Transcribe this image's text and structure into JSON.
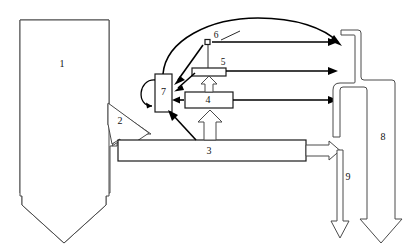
{
  "diagram": {
    "type": "process-flow-schematic",
    "background_color": "#ffffff",
    "line_color": "#000000",
    "hollow_fill": "#ffffff",
    "label_color": "#111111",
    "labels": [
      {
        "id": "1",
        "text": "1",
        "x": 62,
        "y": 65,
        "component": "large-downward-hollow-arrow"
      },
      {
        "id": "2",
        "text": "2",
        "x": 120,
        "y": 122,
        "component": "branch-hollow-arrow"
      },
      {
        "id": "3",
        "text": "3",
        "x": 209,
        "y": 151,
        "component": "horizontal-duct"
      },
      {
        "id": "4",
        "text": "4",
        "x": 207,
        "y": 100,
        "component": "unit-box-4"
      },
      {
        "id": "5",
        "text": "5",
        "x": 223,
        "y": 64,
        "component": "unit-box-5"
      },
      {
        "id": "6",
        "text": "6",
        "x": 214,
        "y": 38,
        "component": "node-6"
      },
      {
        "id": "7",
        "text": "7",
        "x": 163,
        "y": 93,
        "component": "vertical-box-7"
      },
      {
        "id": "8",
        "text": "8",
        "x": 383,
        "y": 138,
        "component": "right-hollow-duct"
      },
      {
        "id": "9",
        "text": "9",
        "x": 348,
        "y": 178,
        "component": "downward-hollow-arrow-9"
      }
    ],
    "components": [
      {
        "name": "large-downward-hollow-arrow",
        "label": "1",
        "style": "hollow-outline"
      },
      {
        "name": "branch-hollow-arrow",
        "label": "2",
        "style": "hollow-outline"
      },
      {
        "name": "horizontal-duct",
        "label": "3",
        "style": "outlined-rectangle"
      },
      {
        "name": "unit-box-4",
        "label": "4",
        "style": "outlined-rectangle"
      },
      {
        "name": "unit-box-5",
        "label": "5",
        "style": "outlined-rectangle"
      },
      {
        "name": "node-6",
        "label": "6",
        "style": "small-square-node"
      },
      {
        "name": "vertical-box-7",
        "label": "7",
        "style": "outlined-rectangle-with-recycle-loop"
      },
      {
        "name": "right-hollow-duct",
        "label": "8",
        "style": "hollow-outline-pipe"
      },
      {
        "name": "downward-hollow-arrow-9",
        "label": "9",
        "style": "hollow-outline"
      }
    ],
    "flows": [
      {
        "from": "1",
        "to": "3",
        "via": "2",
        "style": "hollow-arrow"
      },
      {
        "from": "3",
        "to": "7",
        "style": "solid-arrow"
      },
      {
        "from": "3",
        "to": "4",
        "style": "hollow-arrow-up"
      },
      {
        "from": "4",
        "to": "5",
        "style": "hollow-arrow-up"
      },
      {
        "from": "4",
        "to": "7",
        "style": "solid-arrow-left"
      },
      {
        "from": "5",
        "to": "7",
        "style": "solid-arrow-left"
      },
      {
        "from": "6",
        "to": "7",
        "style": "solid-arrow-left"
      },
      {
        "from": "7",
        "to": "8",
        "style": "solid-arc-over-top"
      },
      {
        "from": "6",
        "to": "8",
        "style": "solid-arrow-right"
      },
      {
        "from": "5",
        "to": "8",
        "style": "solid-arrow-right"
      },
      {
        "from": "4",
        "to": "8",
        "style": "solid-arrow-right"
      },
      {
        "from": "3",
        "to": "outlet",
        "style": "hollow-arrow-right"
      },
      {
        "from": "outlet",
        "to": "9",
        "style": "hollow-arrow-down"
      },
      {
        "from": "8",
        "to": "outlet-bottom",
        "style": "hollow-arrow-down"
      }
    ]
  }
}
